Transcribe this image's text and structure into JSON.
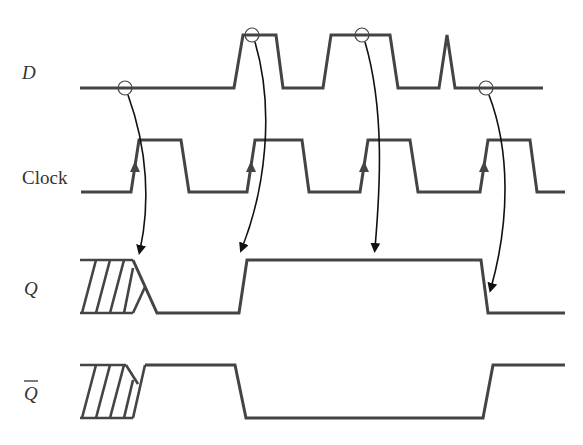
{
  "diagram": {
    "colors": {
      "signal": "#444444",
      "arrow": "#111111",
      "background": "#ffffff"
    },
    "labels": {
      "d": "D",
      "clock": "Clock",
      "q": "Q",
      "q_bar": "Q"
    },
    "signals": [
      {
        "name": "D",
        "points": "80,88 234,88 243,35 276,35 283,88 323,88 331,35 390,35 398,88 439,88 447,35 455,88 543,88"
      },
      {
        "name": "Clock",
        "points": "81,192 131,192 139,140 181,140 189,192 247,192 255,140 302,140 309,192 360,192 368,140 410,140 418,192 480,192 488,140 530,140 537,192 565,192"
      },
      {
        "name": "Q",
        "points": "133,260 157,313 239,313 247,260 481,260 488,313 565,313"
      },
      {
        "name": "Q_bar",
        "points": "145,365 235,365 246,418 483,418 493,365 565,365"
      }
    ],
    "sample_points": [
      {
        "id": "s1",
        "cx": 125,
        "cy": 88
      },
      {
        "id": "s2",
        "cx": 252,
        "cy": 35
      },
      {
        "id": "s3",
        "cx": 362,
        "cy": 35
      },
      {
        "id": "s4",
        "cx": 486,
        "cy": 88
      }
    ],
    "arrows": [
      {
        "id": "a1",
        "path": "M 128,95 C 148,150 150,205 140,250",
        "tip": "140,252"
      },
      {
        "id": "a2",
        "path": "M 255,42 C 275,110 265,190 242,248",
        "tip": "242,252"
      },
      {
        "id": "a3",
        "path": "M 365,42 C 385,110 380,190 375,248",
        "tip": "375,252"
      },
      {
        "id": "a4",
        "path": "M 489,95 C 510,150 510,220 491,288",
        "tip": "491,292"
      }
    ],
    "clock_edge_markers": [
      {
        "x": 135,
        "y": 168
      },
      {
        "x": 251,
        "y": 168
      },
      {
        "x": 364,
        "y": 168
      },
      {
        "x": 484,
        "y": 168
      }
    ]
  }
}
